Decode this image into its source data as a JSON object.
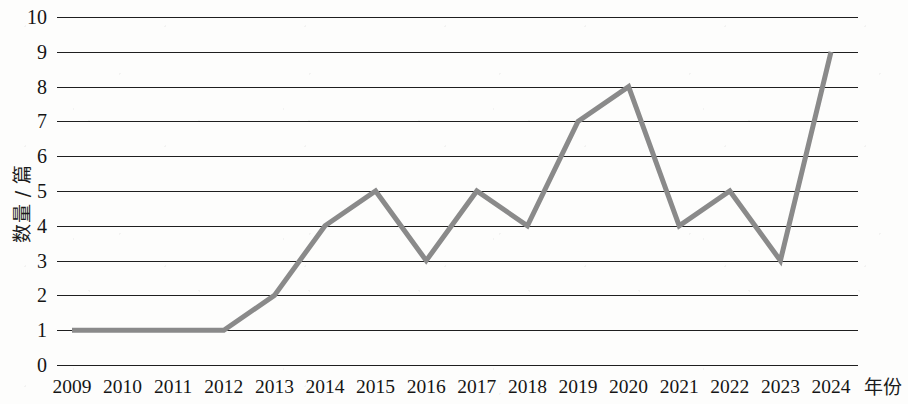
{
  "chart_data": {
    "type": "line",
    "title": "",
    "subtitle": "",
    "xlabel": "年份",
    "ylabel": "数量 / 篇",
    "categories": [
      "2009",
      "2010",
      "2011",
      "2012",
      "2013",
      "2014",
      "2015",
      "2016",
      "2017",
      "2018",
      "2019",
      "2020",
      "2021",
      "2022",
      "2023",
      "2024"
    ],
    "values": [
      1,
      1,
      1,
      1,
      2,
      4,
      5,
      3,
      5,
      4,
      7,
      8,
      4,
      5,
      3,
      9
    ],
    "series": [
      {
        "name": "数量 / 篇",
        "values": [
          1,
          1,
          1,
          1,
          2,
          4,
          5,
          3,
          5,
          4,
          7,
          8,
          4,
          5,
          3,
          9
        ]
      }
    ],
    "ylim": [
      0,
      10
    ],
    "y_ticks": [
      0,
      1,
      2,
      3,
      4,
      5,
      6,
      7,
      8,
      9,
      10
    ],
    "y_tick_labels": [
      "0",
      "1",
      "2",
      "3",
      "4",
      "5",
      "6",
      "7",
      "8",
      "9",
      "10"
    ],
    "grid": "horizontal",
    "legend": "none",
    "line_color": "#8a8a8a",
    "gridline_color": "#1f1f1f",
    "background_color": "#fdfdfc",
    "text_color": "#151515",
    "markers": "none",
    "line_width_px": 5
  }
}
